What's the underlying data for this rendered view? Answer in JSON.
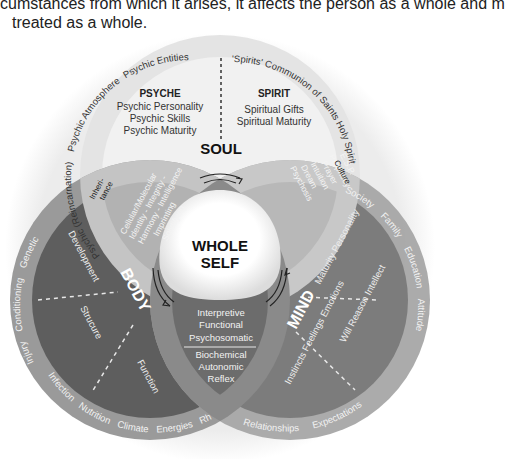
{
  "intro_text": {
    "line1": "cumstances from which it arises, it affects the person as a whole and m",
    "line2": "treated as a whole."
  },
  "center": {
    "line1": "WHOLE",
    "line2": "SELF"
  },
  "soul": {
    "title": "SOUL",
    "psyche": {
      "title": "PSYCHE",
      "items": [
        "Psychic Personality",
        "Psychic Skills",
        "Psychic Maturity"
      ]
    },
    "spirit": {
      "title": "SPIRIT",
      "items": [
        "Spiritual Gifts",
        "Spiritual Maturity"
      ]
    },
    "outer_left": [
      "Psychic (Reincarnation)",
      "Psychic Atmosphere",
      "Psychic Entities"
    ],
    "outer_right": "'Spirits' Communion of Saints Holy Spirit"
  },
  "body": {
    "title": "BODY",
    "segments": [
      "Development",
      "Strucure",
      "Function"
    ],
    "outer": [
      "Injury",
      "Conditioning",
      "Genetic",
      "Infection",
      "Nutrition",
      "Climate",
      "Energies",
      "Rhythms"
    ]
  },
  "mind": {
    "title": "MIND",
    "segments": [
      "Maturity Personality",
      "Will Reason Intellect",
      "Instincts Feelings Emotions"
    ],
    "outer": [
      "Society",
      "Family",
      "Education",
      "Attitudes",
      "Expectations",
      "Relationships"
    ]
  },
  "overlaps": {
    "soul_body": [
      "Cellular/Molecular",
      "Identity - Integrity -",
      "Harmony - Intelligence",
      "Imprinting",
      "Solidifying"
    ],
    "soul_body_tag": [
      "Inheri-",
      "tance"
    ],
    "soul_mind": [
      "Psychosis",
      "Dream",
      "Intuition",
      "Prayer",
      "Prophecy",
      "E.S.P."
    ],
    "soul_mind_tag": "Culture",
    "body_mind_upper": [
      "Interpretive",
      "Functional",
      "Psychosomatic"
    ],
    "body_mind_lower": [
      "Biochemical",
      "Autonomic",
      "Reflex"
    ]
  },
  "colors": {
    "outer_halo": "#ececec",
    "soul_ring": "#e6e6e6",
    "soul_inner": "#f1f1f1",
    "body_ring": "#9a9a9a",
    "body_inner": "#5e5e5e",
    "mind_ring": "#a8a8a8",
    "mind_inner": "#7a7a7a",
    "overlap_soul": "#b4b4b4",
    "center": "#ffffff"
  }
}
